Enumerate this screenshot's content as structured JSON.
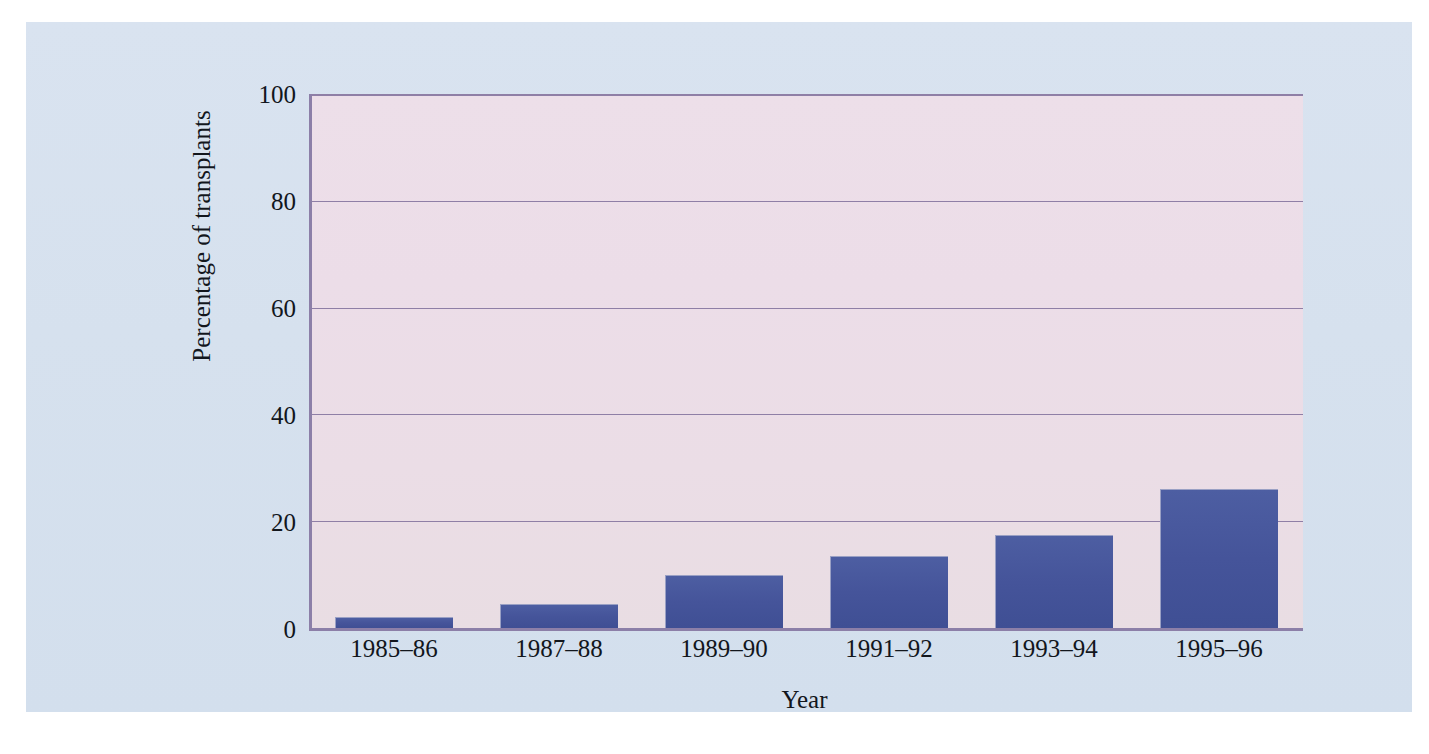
{
  "chart_data": {
    "type": "bar",
    "title": "",
    "subtitle": "",
    "xlabel": "Year",
    "ylabel": "Percentage of transplants",
    "categories": [
      "1985–86",
      "1987–88",
      "1989–90",
      "1991–92",
      "1993–94",
      "1995–96"
    ],
    "values": [
      2,
      4.5,
      10,
      13.5,
      17.5,
      26
    ],
    "series": [
      {
        "name": "Percentage of transplants",
        "values": [
          2,
          4.5,
          10,
          13.5,
          17.5,
          26
        ]
      }
    ],
    "ylim": [
      0,
      100
    ],
    "yticks": [
      0,
      20,
      40,
      60,
      80,
      100
    ],
    "ytick_labels": [
      "0",
      "20",
      "40",
      "60",
      "80",
      "100"
    ],
    "grid": true,
    "grid_axis": "y",
    "legend": false,
    "legend_position": "none",
    "annotations": []
  },
  "style": {
    "bar_color": "#45549a",
    "bar_edge_color": "#9aa0c4",
    "plot_background_top": "#eddfe9",
    "plot_background_bottom": "#e9dde3",
    "panel_background": "#d7e2ef",
    "axis_color": "#8c7fa8",
    "grid_color": "#8f7fa6",
    "text_color": "#12161c",
    "page_background": "#ffffff"
  }
}
